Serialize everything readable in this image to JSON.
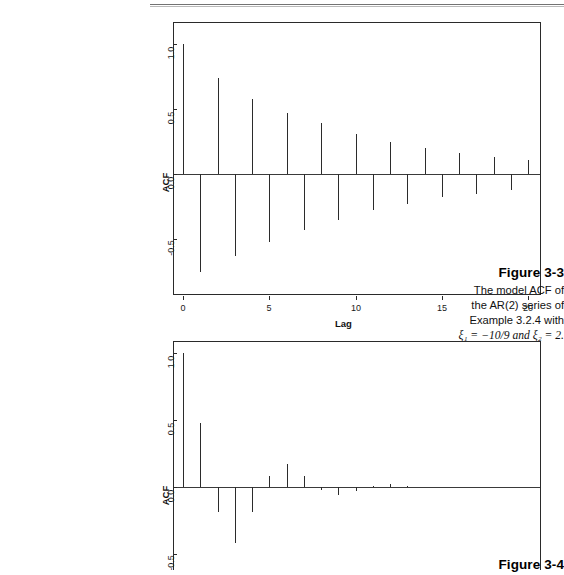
{
  "page": {
    "header_rule": true,
    "background": "#ffffff",
    "ink": "#2b2b2b"
  },
  "figures": [
    {
      "id": "figure-3-3",
      "label": "Figure 3-3",
      "caption_lines": [
        "The model ACF of",
        "the AR(2) series of",
        "Example 3.2.4 with"
      ],
      "caption_math": {
        "xi": "ξ",
        "sub1": "1",
        "sub2": "2",
        "text": "ξ₁ = −10/9 and ξ₂ = 2."
      },
      "chart_data": {
        "type": "bar",
        "title": "",
        "subtitle": "",
        "xlabel": "Lag",
        "ylabel": "ACF",
        "xlim": [
          -1,
          21
        ],
        "ylim": [
          -0.8,
          1.08
        ],
        "grid": false,
        "legend": null,
        "xticks": [
          0,
          5,
          10,
          15,
          20
        ],
        "xticklabels": [
          "0",
          "5",
          "10",
          "15",
          "20"
        ],
        "yticks": [
          -0.5,
          0.0,
          0.5,
          1.0
        ],
        "yticklabels": [
          "-0.5",
          "0.0",
          "0.5",
          "1.0"
        ],
        "categories": [
          0,
          1,
          2,
          3,
          4,
          5,
          6,
          7,
          8,
          9,
          10,
          11,
          12,
          13,
          14,
          15,
          16,
          17,
          18,
          19,
          20
        ],
        "values": [
          1.0,
          -0.75,
          0.74,
          -0.63,
          0.58,
          -0.52,
          0.47,
          -0.43,
          0.39,
          -0.35,
          0.31,
          -0.28,
          0.25,
          -0.23,
          0.2,
          -0.18,
          0.16,
          -0.15,
          0.13,
          -0.12,
          0.11
        ]
      }
    },
    {
      "id": "figure-3-4",
      "label": "Figure 3-4",
      "caption_lines": [],
      "chart_data": {
        "type": "bar",
        "title": "",
        "xlabel": "",
        "ylabel": "ACF",
        "xlim": [
          -1,
          21
        ],
        "ylim": [
          -0.55,
          1.08
        ],
        "grid": false,
        "legend": null,
        "xticks": [],
        "xticklabels": [],
        "yticks": [
          -0.5,
          0.0,
          0.5,
          1.0
        ],
        "yticklabels": [
          "-0.5",
          "0.0",
          "0.5",
          "1.0"
        ],
        "categories": [
          0,
          1,
          2,
          3,
          4,
          5,
          6,
          7,
          8,
          9,
          10,
          11,
          12,
          13,
          14,
          15,
          16,
          17,
          18,
          19,
          20
        ],
        "values": [
          1.0,
          0.48,
          -0.19,
          -0.42,
          -0.19,
          0.08,
          0.17,
          0.08,
          -0.02,
          -0.06,
          -0.03,
          0.01,
          0.02,
          0.01,
          0.0,
          0.0,
          0.0,
          0.0,
          0.0,
          0.0,
          0.0
        ]
      }
    }
  ]
}
